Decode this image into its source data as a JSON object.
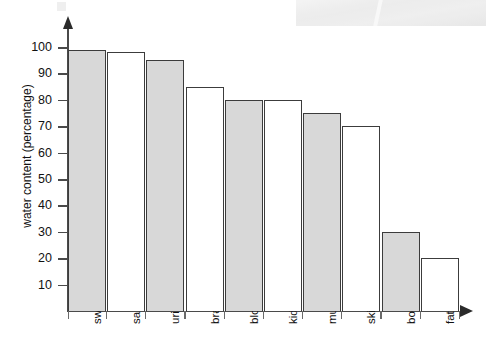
{
  "chart_data": {
    "type": "bar",
    "title": "",
    "xlabel": "",
    "ylabel": "water content (percentage)",
    "ylim": [
      0,
      105
    ],
    "yticks": [
      10,
      20,
      30,
      40,
      50,
      60,
      70,
      80,
      90,
      100
    ],
    "grid": false,
    "legend": "none",
    "categories": [
      "sweat",
      "saliva",
      "urine",
      "brain",
      "blood",
      "kidneys",
      "muscle",
      "skin",
      "bone",
      "fat"
    ],
    "values": [
      99,
      98,
      95,
      85,
      80,
      80,
      75,
      70,
      30,
      20
    ],
    "bar_styles": [
      "shaded",
      "plain",
      "shaded",
      "plain",
      "shaded",
      "plain",
      "shaded",
      "plain",
      "shaded",
      "plain"
    ],
    "colors": {
      "bar_fill_shaded": "#d8d8d8",
      "bar_fill_plain": "#ffffff",
      "bar_stroke": "#3c3c3c",
      "axis": "#4a4a4a",
      "text": "#111111",
      "background": "#ffffff"
    }
  },
  "axis": {
    "y_title": "water content (percentage)",
    "tick_labels": [
      "100",
      "90",
      "80",
      "70",
      "60",
      "50",
      "40",
      "30",
      "20",
      "10"
    ]
  },
  "icons": {
    "y_axis_arrow": "arrow-up-icon",
    "x_axis_arrow": "arrow-right-icon"
  }
}
